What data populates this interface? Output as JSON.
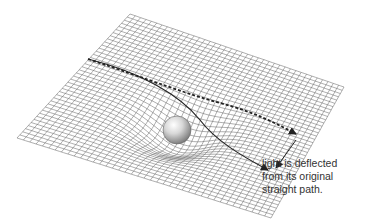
{
  "diagram": {
    "grid": {
      "corners": {
        "top": [
          130,
          14
        ],
        "right": [
          344,
          87
        ],
        "bottom": [
          271,
          218
        ],
        "left": [
          17,
          138
        ]
      },
      "divisions": 40,
      "color": "#6a6a6a",
      "well_center": [
        178,
        128
      ],
      "well_depth": 22
    },
    "mass": {
      "label": "massive body (sphere)",
      "cx": 177,
      "cy": 130,
      "r": 14
    },
    "paths": [
      {
        "name": "original-straight-path",
        "style": "dashed",
        "color": "#222222"
      },
      {
        "name": "deflected-light-path",
        "style": "solid",
        "color": "#222222"
      }
    ],
    "caption": {
      "lines": [
        "light is deflected",
        "from its original",
        "straight path."
      ]
    }
  }
}
